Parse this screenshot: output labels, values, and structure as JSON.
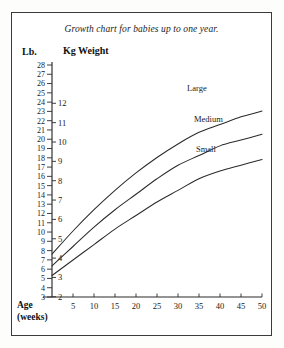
{
  "figure": {
    "title": "Growth chart for babies up to one year.",
    "left_unit_header": "Lb.",
    "right_unit_header": "Kg Weight",
    "x_axis_label_line1": "Age",
    "x_axis_label_line2": "(weeks)",
    "line_color": "#2b2b2b",
    "background_color": "#ffffff",
    "border_color": "#3a3a3a"
  },
  "chart_data": {
    "type": "line",
    "title": "Growth chart for babies up to one year.",
    "xlabel": "Age (weeks)",
    "ylabel": "Kg Weight",
    "ylabel_secondary": "Lb.",
    "grid": false,
    "legend": "inline-curve-labels",
    "xlim": [
      0,
      50
    ],
    "ylim_kg": [
      1.6,
      12.6
    ],
    "ylim_lb": [
      3,
      28
    ],
    "xticks": [
      5,
      10,
      15,
      20,
      25,
      30,
      35,
      40,
      45,
      50
    ],
    "yticks_kg": [
      2,
      3,
      4,
      5,
      6,
      7,
      8,
      9,
      10,
      11,
      12
    ],
    "yticks_lb": [
      3,
      4,
      5,
      6,
      7,
      8,
      9,
      10,
      11,
      12,
      13,
      14,
      15,
      16,
      17,
      18,
      19,
      20,
      21,
      22,
      23,
      24,
      25,
      26,
      27,
      28
    ],
    "x": [
      0,
      5,
      10,
      15,
      20,
      25,
      30,
      35,
      40,
      45,
      50
    ],
    "series": [
      {
        "name": "Large",
        "label": "Large",
        "unit": "kg",
        "values": [
          4.2,
          5.4,
          6.5,
          7.5,
          8.4,
          9.2,
          9.9,
          10.5,
          10.9,
          11.3,
          11.6
        ]
      },
      {
        "name": "Medium",
        "label": "Medium",
        "unit": "kg",
        "values": [
          3.6,
          4.6,
          5.6,
          6.5,
          7.3,
          8.1,
          8.8,
          9.3,
          9.8,
          10.1,
          10.4
        ]
      },
      {
        "name": "Small",
        "label": "Small",
        "unit": "kg",
        "values": [
          3.1,
          3.9,
          4.7,
          5.5,
          6.2,
          6.9,
          7.5,
          8.1,
          8.5,
          8.8,
          9.1
        ]
      }
    ]
  },
  "geometry": {
    "x0_px": 52,
    "x50_px": 262,
    "kg_zero_px": 335.5,
    "kg_unit_px": 19.35,
    "lb_3_px": 297,
    "lb_28_px": 65
  }
}
